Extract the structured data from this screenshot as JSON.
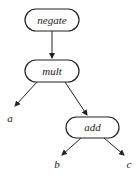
{
  "diagram": {
    "type": "expression-tree",
    "colors": {
      "stroke": "#222222",
      "background": "#ffffff"
    },
    "nodes": {
      "negate": {
        "label": "negate"
      },
      "mult": {
        "label": "mult"
      },
      "add": {
        "label": "add"
      },
      "a": {
        "label": "a"
      },
      "b": {
        "label": "b"
      },
      "c": {
        "label": "c"
      }
    },
    "edges": [
      {
        "from": "negate",
        "to": "mult"
      },
      {
        "from": "mult",
        "to": "a"
      },
      {
        "from": "mult",
        "to": "add"
      },
      {
        "from": "add",
        "to": "b"
      },
      {
        "from": "add",
        "to": "c"
      }
    ]
  }
}
